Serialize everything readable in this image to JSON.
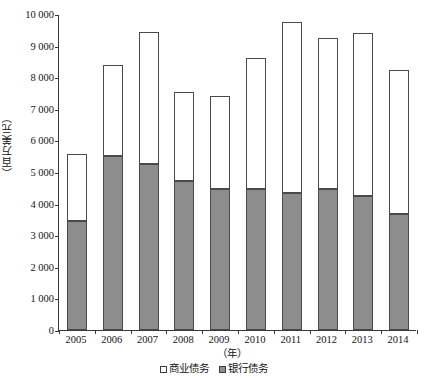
{
  "chart_data": {
    "type": "bar",
    "subtype": "stacked-vertical",
    "title": "",
    "xlabel": "（年）",
    "ylabel": "（百万美元）",
    "categories": [
      "2005",
      "2006",
      "2007",
      "2008",
      "2009",
      "2010",
      "2011",
      "2012",
      "2013",
      "2014"
    ],
    "series": [
      {
        "name": "银行债务",
        "color": "#8d8d8d",
        "values": [
          3450,
          5500,
          5250,
          4700,
          4470,
          4470,
          4330,
          4470,
          4250,
          3680
        ]
      },
      {
        "name": "商业债务",
        "color": "#ffffff",
        "values": [
          2120,
          2900,
          4170,
          2830,
          2940,
          4130,
          5420,
          4760,
          5150,
          4550
        ]
      }
    ],
    "totals": [
      5570,
      8400,
      9420,
      7530,
      7410,
      8600,
      9750,
      9230,
      9400,
      8230
    ],
    "ylim": [
      0,
      10000
    ],
    "ytick_step": 1000,
    "ytick_labels": [
      "10 000",
      "9 000",
      "8 000",
      "7 000",
      "6 000",
      "5 000",
      "4 000",
      "3 000",
      "2 000",
      "1 000",
      "0"
    ],
    "ytick_values": [
      10000,
      9000,
      8000,
      7000,
      6000,
      5000,
      4000,
      3000,
      2000,
      1000,
      0
    ],
    "grid": false,
    "legend_position": "bottom-center",
    "legend": [
      {
        "label": "商业债务",
        "swatch_color": "#ffffff"
      },
      {
        "label": "银行债务",
        "swatch_color": "#8d8d8d"
      }
    ],
    "axis_color": "#3a3a3a",
    "bar_border_color": "#4a4a4a"
  }
}
